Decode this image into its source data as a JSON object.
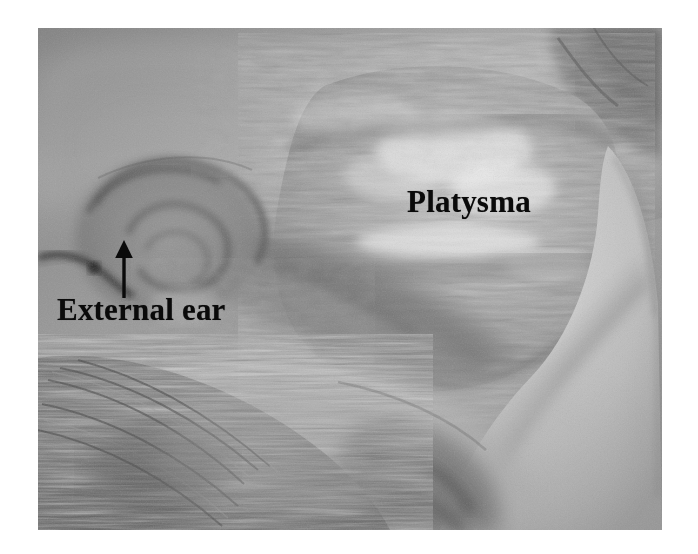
{
  "figure": {
    "kind": "anatomical-dissection-photograph",
    "color_mode": "grayscale",
    "page_background": "#ffffff",
    "plate": {
      "x": 38,
      "y": 28,
      "width": 624,
      "height": 502,
      "base_tone": "#8e8e8e"
    }
  },
  "annotations": [
    {
      "id": "platysma",
      "text": "Platysma",
      "x": 407,
      "y": 186,
      "font_size": 31,
      "color": "#0a0a0a",
      "has_leader": false
    },
    {
      "id": "external-ear",
      "text": "External ear",
      "x": 57,
      "y": 294,
      "font_size": 31,
      "color": "#0a0a0a",
      "has_leader": true,
      "leader": {
        "type": "arrow",
        "direction": "up",
        "tail_x": 124,
        "tail_y": 298,
        "tip_x": 124,
        "tip_y": 241,
        "color": "#0a0a0a"
      }
    }
  ],
  "labels": {
    "platysma": "Platysma",
    "external_ear": "External ear"
  },
  "regions": [
    {
      "name": "platysma-muscle-sheet",
      "tone": "#a6a6a6",
      "note": "fibrous striated muscle with bright glistening highlights, upper-right"
    },
    {
      "name": "external-ear-auricle",
      "tone": "#8a8a8a",
      "note": "curved helix and concha whorl, left-middle"
    },
    {
      "name": "scalp-hair",
      "tone": "#6e6e6e",
      "note": "radiating hair strands, lower-left"
    },
    {
      "name": "reflected-skin-flap",
      "tone": "#bfbfbf",
      "note": "pale smooth skin flap, right and lower-right"
    },
    {
      "name": "dark-background-corner",
      "tone": "#6a6a6a",
      "note": "shadowed corner, upper-right"
    },
    {
      "name": "shadow-hollow",
      "tone": "#4a4a4a",
      "note": "dark recess below ear lobe, bottom-center"
    }
  ]
}
